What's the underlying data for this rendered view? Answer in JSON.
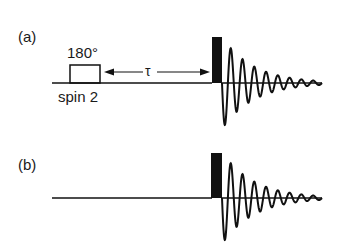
{
  "diagram": {
    "panel_a": {
      "label": "(a)",
      "pulse_label": "180°",
      "pulse_target": "spin 2",
      "delay_symbol": "τ"
    },
    "panel_b": {
      "label": "(b)"
    },
    "colors": {
      "ink": "#111111",
      "background": "#ffffff"
    }
  }
}
